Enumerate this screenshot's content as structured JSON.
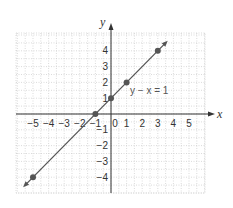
{
  "chart_data": {
    "type": "line",
    "title": "",
    "xlabel": "x",
    "ylabel": "y",
    "xlim": [
      -6,
      6
    ],
    "ylim": [
      -5,
      5
    ],
    "x_ticks": [
      "-5",
      "-4",
      "-3",
      "-2",
      "-1",
      "0",
      "1",
      "2",
      "3",
      "4",
      "5"
    ],
    "y_ticks": [
      "4",
      "3",
      "2",
      "1",
      "-1",
      "-2",
      "-3",
      "-4"
    ],
    "grid": true,
    "series": [
      {
        "name": "y − x = 1",
        "equation": "y − x = 1",
        "color": "#555555",
        "points": [
          {
            "x": -5,
            "y": -4
          },
          {
            "x": -1,
            "y": 0
          },
          {
            "x": 0,
            "y": 1
          },
          {
            "x": 1,
            "y": 2
          },
          {
            "x": 3,
            "y": 4
          }
        ]
      }
    ],
    "annotations": [
      {
        "text": "y − x = 1",
        "x": 1.2,
        "y": 1.2
      }
    ]
  },
  "colors": {
    "axis": "#333333",
    "grid": "#cccccc",
    "line": "#555555",
    "point": "#555555"
  }
}
